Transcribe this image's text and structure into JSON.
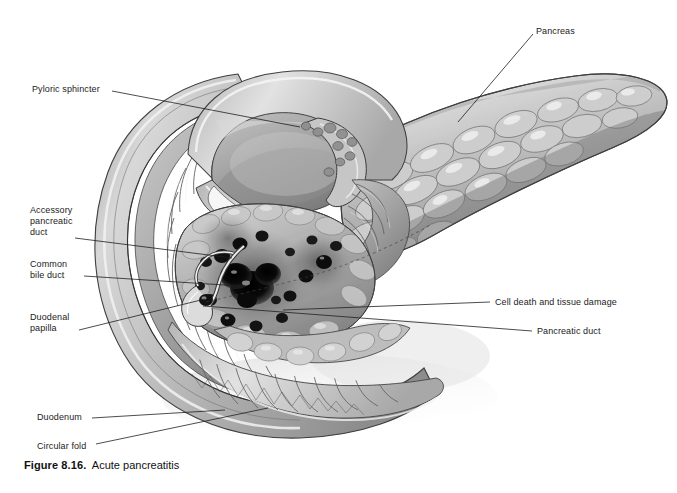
{
  "figure": {
    "caption_number": "Figure 8.16.",
    "caption_title": "Acute pancreatitis",
    "background_color": "#ffffff",
    "ink_color": "#1b1b1b",
    "style": "grayscale medical line-and-wash illustration"
  },
  "labels": [
    {
      "id": "pyloric-sphincter",
      "text": "Pyloric sphincter",
      "x": 32,
      "y": 84,
      "align": "left",
      "leader": {
        "x1": 112,
        "y1": 91,
        "x2": 300,
        "y2": 127
      }
    },
    {
      "id": "pancreas",
      "text": "Pancreas",
      "x": 536,
      "y": 26,
      "align": "left",
      "leader": {
        "x1": 533,
        "y1": 34,
        "x2": 458,
        "y2": 122
      }
    },
    {
      "id": "accessory-pancreatic-duct",
      "text": "Accessory\npancreatic\nduct",
      "x": 30,
      "y": 205,
      "align": "left",
      "leader": {
        "x1": 75,
        "y1": 238,
        "x2": 232,
        "y2": 258
      }
    },
    {
      "id": "common-bile-duct",
      "text": "Common\nbile duct",
      "x": 30,
      "y": 259,
      "align": "left",
      "leader": {
        "x1": 84,
        "y1": 276,
        "x2": 240,
        "y2": 286
      }
    },
    {
      "id": "duodenal-papilla",
      "text": "Duodenal\npapilla",
      "x": 30,
      "y": 312,
      "align": "left",
      "leader": {
        "x1": 79,
        "y1": 330,
        "x2": 205,
        "y2": 299
      }
    },
    {
      "id": "duodenum",
      "text": "Duodenum",
      "x": 37,
      "y": 412,
      "align": "left",
      "leader": {
        "x1": 92,
        "y1": 418,
        "x2": 225,
        "y2": 410
      }
    },
    {
      "id": "circular-fold",
      "text": "Circular fold",
      "x": 37,
      "y": 441,
      "align": "left",
      "leader": {
        "x1": 96,
        "y1": 444,
        "x2": 268,
        "y2": 408
      }
    },
    {
      "id": "cell-death-and-tissue-damage",
      "text": "Cell death and tissue damage",
      "x": 495,
      "y": 297,
      "align": "left",
      "leader": {
        "x1": 490,
        "y1": 302,
        "x2": 283,
        "y2": 310
      }
    },
    {
      "id": "pancreatic-duct",
      "text": "Pancreatic duct",
      "x": 537,
      "y": 326,
      "align": "left",
      "leader": {
        "x1": 532,
        "y1": 331,
        "x2": 203,
        "y2": 306
      }
    }
  ],
  "anatomy": {
    "structures": [
      "pancreas body and tail",
      "pancreatic head",
      "duodenum C-loop",
      "pyloric sphincter",
      "duodenal mucosa with circular folds",
      "common bile duct",
      "accessory pancreatic duct",
      "duodenal papilla",
      "necrotic foci"
    ],
    "lesion_description": "dark necrotic foci scattered over the head and neck of the pancreas"
  },
  "palette": {
    "paper": "#ffffff",
    "tissue_light": "#e6e6e6",
    "tissue_mid": "#b9b9b9",
    "tissue_dark": "#8a8a8a",
    "tissue_deep": "#5d5d5d",
    "outline": "#3a3a3a",
    "necrosis": "#0d0d0d",
    "lumen_shadow": "#9a9a9a",
    "highlight": "#f4f4f4"
  }
}
